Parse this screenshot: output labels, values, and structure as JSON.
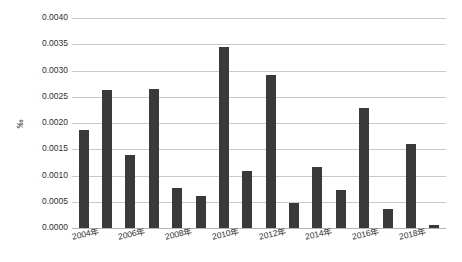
{
  "chart_data": {
    "type": "bar",
    "title": "",
    "subtitle": "",
    "xlabel": "",
    "ylabel": "‰",
    "categories": [
      "2004年",
      "2005年",
      "2006年",
      "2007年",
      "2008年",
      "2009年",
      "2010年",
      "2011年",
      "2012年",
      "2013年",
      "2014年",
      "2015年",
      "2016年",
      "2017年",
      "2018年",
      "2019年"
    ],
    "values": [
      0.00187,
      0.00263,
      0.00139,
      0.00265,
      0.00077,
      0.00061,
      0.00345,
      0.00109,
      0.00291,
      0.00047,
      0.00116,
      0.00073,
      0.00229,
      0.00036,
      0.0016,
      6e-05
    ],
    "ylim": [
      0.0,
      0.004
    ],
    "ytick_values": [
      0.0,
      0.0005,
      0.001,
      0.0015,
      0.002,
      0.0025,
      0.003,
      0.0035,
      0.004
    ],
    "ytick_labels": [
      "0.0000",
      "0.0005",
      "0.0010",
      "0.0015",
      "0.0020",
      "0.0025",
      "0.0030",
      "0.0035",
      "0.0040"
    ],
    "xtick_labels": [
      "2004年",
      "2006年",
      "2008年",
      "2010年",
      "2012年",
      "2014年",
      "2016年",
      "2018年"
    ],
    "xtick_indices": [
      0,
      2,
      4,
      6,
      8,
      10,
      12,
      14
    ],
    "grid": true,
    "grid_axis": "y",
    "legend": false,
    "legend_position": "none",
    "bar_color": "#3a3a3a",
    "grid_color": "#c9c9c9",
    "background_color": "#ffffff"
  }
}
